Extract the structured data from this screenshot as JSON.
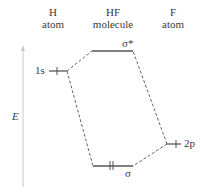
{
  "columns": [
    {
      "line1": "H",
      "line2": "atom"
    },
    {
      "line1": "HF",
      "line2": "molecule"
    },
    {
      "line1": "F",
      "line2": "atom"
    }
  ],
  "axis": {
    "label": "E"
  },
  "levels": {
    "h_1s": {
      "label": "1s",
      "electrons": "↑"
    },
    "sigma_star": {
      "label": "σ*"
    },
    "sigma": {
      "label": "σ",
      "electrons": "↑↓"
    },
    "f_2p": {
      "label": "2p",
      "electrons": "↑"
    }
  },
  "colors": {
    "line": "#555555",
    "dashed": "#666666",
    "axis": "#bbbbbb"
  }
}
